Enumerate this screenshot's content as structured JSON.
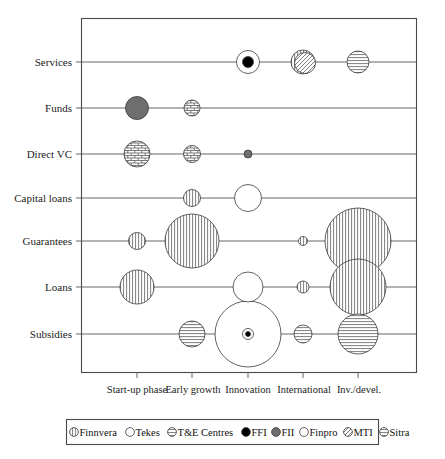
{
  "figure": {
    "title": "",
    "width": 445,
    "height": 459
  },
  "chart_data": {
    "type": "scatter",
    "subtype": "bubble-matrix",
    "title": "",
    "xlabel": "",
    "ylabel": "",
    "grid": false,
    "legend_position": "bottom",
    "categories_x": [
      "Start-up phase",
      "Early growth",
      "Innovation",
      "International",
      "Inv./devel."
    ],
    "categories_y": [
      "Services",
      "Funds",
      "Direct VC",
      "Capital loans",
      "Guarantees",
      "Loans",
      "Subsidies"
    ],
    "organisations": [
      {
        "name": "Finnvera",
        "key": "finnvera",
        "pattern": "vertical-hatch",
        "fill": "#ffffff"
      },
      {
        "name": "Tekes",
        "key": "tekes",
        "pattern": "none",
        "fill": "#ffffff"
      },
      {
        "name": "T&E Centres",
        "key": "tecentres",
        "pattern": "horizontal-hatch",
        "fill": "#ffffff"
      },
      {
        "name": "FFI",
        "key": "ffi",
        "pattern": "solid",
        "fill": "#000000"
      },
      {
        "name": "FII",
        "key": "fii",
        "pattern": "solid",
        "fill": "#6e6e6e"
      },
      {
        "name": "Finpro",
        "key": "finpro",
        "pattern": "none",
        "fill": "#ffffff"
      },
      {
        "name": "MTI",
        "key": "mti",
        "pattern": "diagonal-hatch",
        "fill": "#ffffff"
      },
      {
        "name": "Sitra",
        "key": "sitra",
        "pattern": "horizontal-hatch",
        "fill": "#ffffff"
      }
    ],
    "bubbles": [
      {
        "row": "Services",
        "col": "Innovation",
        "org": "Finpro",
        "r": 11.5
      },
      {
        "row": "Services",
        "col": "Innovation",
        "org": "FFI",
        "r": 5.5
      },
      {
        "row": "Services",
        "col": "International",
        "org": "Finnvera",
        "r": 12.0
      },
      {
        "row": "Services",
        "col": "International",
        "org": "MTI",
        "r": 10.5
      },
      {
        "row": "Services",
        "col": "Inv./devel.",
        "org": "T&E Centres",
        "r": 11.0
      },
      {
        "row": "Funds",
        "col": "Start-up phase",
        "org": "FII",
        "r": 11.5
      },
      {
        "row": "Funds",
        "col": "Early growth",
        "org": "Sitra",
        "r": 8.0
      },
      {
        "row": "Direct VC",
        "col": "Start-up phase",
        "org": "Sitra",
        "r": 13.0
      },
      {
        "row": "Direct VC",
        "col": "Early growth",
        "org": "Sitra",
        "r": 8.5
      },
      {
        "row": "Direct VC",
        "col": "Innovation",
        "org": "FII",
        "r": 4.0
      },
      {
        "row": "Capital loans",
        "col": "Early growth",
        "org": "Finnvera",
        "r": 8.5
      },
      {
        "row": "Capital loans",
        "col": "Innovation",
        "org": "Tekes",
        "r": 13.5
      },
      {
        "row": "Guarantees",
        "col": "Start-up phase",
        "org": "Finnvera",
        "r": 8.5
      },
      {
        "row": "Guarantees",
        "col": "Early growth",
        "org": "Finnvera",
        "r": 27.0
      },
      {
        "row": "Guarantees",
        "col": "International",
        "org": "Finnvera",
        "r": 4.5
      },
      {
        "row": "Guarantees",
        "col": "Inv./devel.",
        "org": "Finnvera",
        "r": 33.0
      },
      {
        "row": "Loans",
        "col": "Start-up phase",
        "org": "Finnvera",
        "r": 17.0
      },
      {
        "row": "Loans",
        "col": "Innovation",
        "org": "Tekes",
        "r": 15.0
      },
      {
        "row": "Loans",
        "col": "International",
        "org": "Finnvera",
        "r": 6.0
      },
      {
        "row": "Loans",
        "col": "Inv./devel.",
        "org": "Finnvera",
        "r": 28.0
      },
      {
        "row": "Subsidies",
        "col": "Early growth",
        "org": "T&E Centres",
        "r": 13.0
      },
      {
        "row": "Subsidies",
        "col": "Innovation",
        "org": "Tekes",
        "r": 33.0
      },
      {
        "row": "Subsidies",
        "col": "Innovation",
        "org": "Finpro",
        "r": 5.5
      },
      {
        "row": "Subsidies",
        "col": "Innovation",
        "org": "FFI",
        "r": 2.5
      },
      {
        "row": "Subsidies",
        "col": "International",
        "org": "T&E Centres",
        "r": 9.0
      },
      {
        "row": "Subsidies",
        "col": "Inv./devel.",
        "org": "T&E Centres",
        "r": 20.0
      }
    ]
  },
  "axes": {
    "y_labels": [
      "Services",
      "Funds",
      "Direct VC",
      "Capital loans",
      "Guarantees",
      "Loans",
      "Subsidies"
    ],
    "x_labels": [
      "Start-up phase",
      "Early growth",
      "Innovation",
      "International",
      "Inv./devel."
    ]
  },
  "legend": {
    "items": [
      {
        "label": "Finnvera",
        "marker": "vertical-hatch-circle"
      },
      {
        "label": "Tekes",
        "marker": "open-circle"
      },
      {
        "label": "T&E Centres",
        "marker": "horizontal-hatch-circle"
      },
      {
        "label": "FFI",
        "marker": "filled-black-circle"
      },
      {
        "label": "FII",
        "marker": "filled-gray-circle"
      },
      {
        "label": "Finpro",
        "marker": "open-circle"
      },
      {
        "label": "MTI",
        "marker": "diagonal-hatch-circle"
      },
      {
        "label": "Sitra",
        "marker": "horizontal-hatch-circle"
      }
    ]
  },
  "colors": {
    "frame": "#4a4a4a",
    "line": "#555555",
    "bubble_stroke": "#3a3a3a",
    "fii_fill": "#6e6e6e",
    "ffi_fill": "#000000",
    "background": "#ffffff"
  }
}
